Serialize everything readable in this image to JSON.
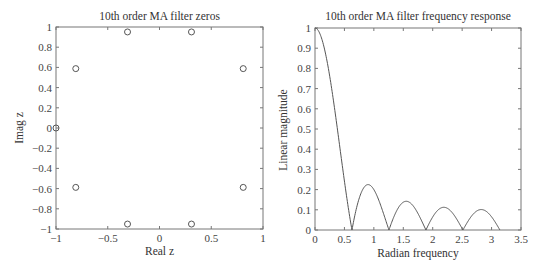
{
  "chart_data": [
    {
      "type": "scatter",
      "title": "10th order MA filter zeros",
      "xlabel": "Real z",
      "ylabel": "Imag z",
      "xlim": [
        -1,
        1
      ],
      "ylim": [
        -1,
        1
      ],
      "xticks": [
        "-1",
        "-0.5",
        "0",
        "0.5",
        "1"
      ],
      "yticks": [
        "-1",
        "-0.8",
        "-0.6",
        "-0.4",
        "-0.2",
        "0",
        "0.2",
        "0.4",
        "0.6",
        "0.8",
        "1"
      ],
      "grid": false,
      "marker": "circle-open",
      "series": [
        {
          "name": "zeros",
          "points": [
            {
              "x": -1.0,
              "y": 0.0
            },
            {
              "x": -0.809,
              "y": 0.588
            },
            {
              "x": -0.809,
              "y": -0.588
            },
            {
              "x": -0.309,
              "y": 0.951
            },
            {
              "x": -0.309,
              "y": -0.951
            },
            {
              "x": 0.309,
              "y": 0.951
            },
            {
              "x": 0.309,
              "y": -0.951
            },
            {
              "x": 0.809,
              "y": 0.588
            },
            {
              "x": 0.809,
              "y": -0.588
            }
          ]
        }
      ]
    },
    {
      "type": "line",
      "title": "10th order MA filter frequency response",
      "xlabel": "Radian frequency",
      "ylabel": "Linear magnitude",
      "xlim": [
        0,
        3.5
      ],
      "ylim": [
        0,
        1
      ],
      "xticks": [
        "0",
        "0.5",
        "1",
        "1.5",
        "2",
        "2.5",
        "3",
        "3.5"
      ],
      "yticks": [
        "0",
        "0.1",
        "0.2",
        "0.3",
        "0.4",
        "0.5",
        "0.6",
        "0.7",
        "0.8",
        "0.9",
        "1"
      ],
      "grid": false,
      "series": [
        {
          "name": "|H(w)|",
          "formula": "|sin(5w) / (10 sin(w/2))|",
          "x": [
            0,
            0.1,
            0.2,
            0.3,
            0.4,
            0.5,
            0.628,
            0.75,
            0.94,
            1.1,
            1.257,
            1.4,
            1.57,
            1.75,
            1.885,
            2.05,
            2.2,
            2.35,
            2.513,
            2.65,
            2.83,
            3.0,
            3.14
          ],
          "values": [
            1.0,
            0.96,
            0.85,
            0.67,
            0.46,
            0.25,
            0.0,
            0.14,
            0.22,
            0.13,
            0.0,
            0.09,
            0.14,
            0.07,
            0.0,
            0.08,
            0.11,
            0.07,
            0.0,
            0.06,
            0.1,
            0.06,
            0.0
          ],
          "peaks": [
            {
              "x": 0.94,
              "y": 0.225
            },
            {
              "x": 1.57,
              "y": 0.141
            },
            {
              "x": 2.2,
              "y": 0.111
            },
            {
              "x": 2.83,
              "y": 0.101
            }
          ],
          "zeros_x": [
            0.628,
            1.257,
            1.885,
            2.513,
            3.142
          ]
        }
      ]
    }
  ]
}
